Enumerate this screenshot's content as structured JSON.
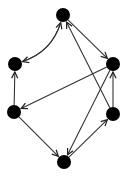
{
  "diagram": {
    "type": "directed-graph",
    "colors": {
      "node": "#000000",
      "edge": "#333333",
      "background": "#ffffff"
    },
    "nodes": [
      {
        "id": "top",
        "x": 63,
        "y": 15
      },
      {
        "id": "left-upper",
        "x": 15,
        "y": 64
      },
      {
        "id": "right-upper",
        "x": 113,
        "y": 64
      },
      {
        "id": "left-lower",
        "x": 14,
        "y": 112
      },
      {
        "id": "right-lower",
        "x": 113,
        "y": 114
      },
      {
        "id": "bottom",
        "x": 64,
        "y": 162
      }
    ],
    "edges": [
      {
        "from": "left-upper",
        "to": "top",
        "curve": "left"
      },
      {
        "from": "top",
        "to": "left-upper",
        "curve": "right"
      },
      {
        "from": "top",
        "to": "right-upper"
      },
      {
        "from": "right-lower",
        "to": "top"
      },
      {
        "from": "left-lower",
        "to": "left-upper"
      },
      {
        "from": "right-upper",
        "to": "left-lower"
      },
      {
        "from": "left-lower",
        "to": "bottom"
      },
      {
        "from": "right-upper",
        "to": "bottom"
      },
      {
        "from": "bottom",
        "to": "right-lower"
      },
      {
        "from": "right-lower",
        "to": "right-upper"
      }
    ]
  }
}
